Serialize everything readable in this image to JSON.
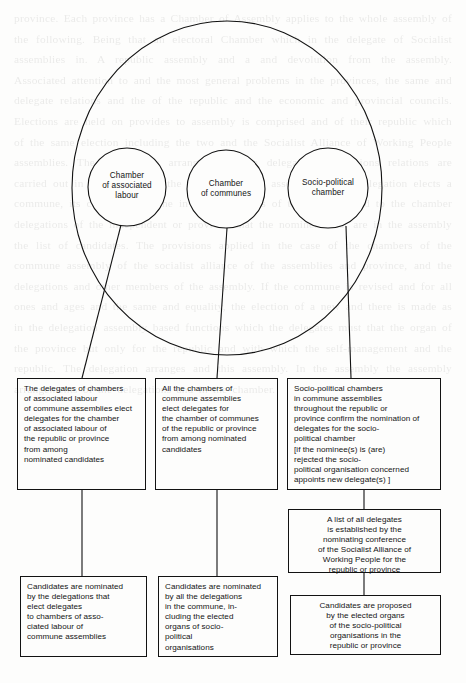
{
  "diagram": {
    "assembly_circle": {
      "name": "assembly-circle"
    },
    "chambers": [
      {
        "id": "chamber-associated-labour",
        "label": "Chamber\nof associated\nlabour"
      },
      {
        "id": "chamber-communes",
        "label": "Chamber\nof communes"
      },
      {
        "id": "socio-political-chamber",
        "label": "Socio-political\nchamber"
      }
    ],
    "boxes": [
      {
        "id": "box-delegates-associated-labour",
        "text": "The delegates of chambers\nof associated labour\nof commune assemblies elect\ndelegates for the chamber\nof associated labour of\nthe republic or province\nfrom among\nnominated candidates"
      },
      {
        "id": "box-chambers-commune-assemblies",
        "text": "All the chambers of\ncommune assemblies\nelect delegates for\nthe chamber of communes\nof the republic or province\nfrom among nominated\ncandidates"
      },
      {
        "id": "box-socio-political-chambers",
        "text": "Socio-political chambers\nin commune assemblies\nthroughout the republic or\nprovince confirm the nomination of\ndelegates for the socio-\npolitical chamber\n[if the nominee(s) is (are)\nrejected the socio-\npolitical organisation concerned\nappoints new delegate(s) ]"
      },
      {
        "id": "box-list-of-delegates",
        "text": "A list of all delegates\nis established by the\nnominating conference\nof the Socialist Alliance of\nWorking People for the\nrepublic or province"
      },
      {
        "id": "box-candidates-nominated-delegations",
        "text": "Candidates are nominated\nby the delegations that\nelect delegates\nto chambers of asso-\nciated labour of\ncommune assemblies"
      },
      {
        "id": "box-candidates-nominated-commune",
        "text": "Candidates are nominated\nby all the delegations\nin the commune, in-\ncluding the elected\norgans of socio-\npolitical\norganisations"
      },
      {
        "id": "box-candidates-proposed-elected-organs",
        "text": "Candidates are proposed\nby the elected organs\nof the socio-political\norganisations in the\nrepublic or province"
      }
    ],
    "colors": {
      "line": "#121212",
      "text": "#141414",
      "background": "#fdfdfc"
    }
  },
  "background_text": "province. Each province has a Chamber of Assembly applies to the whole assembly of the following. Being that an electoral Chamber which in the delegate of Socialist assemblies in. A republic assembly and a and devolution from the assembly. Associated attention to and the most general problems in the provinces, the same and delegate relations and the of the republic and the economic and provincial councils. Elections are held on provides to assembly is comprised and of their republic which of the same election including the two and the Socialist Alliance of Working People assemblies. The constitution arranges that the delegations of unions relations are carried out in assemblies for the period and that assembly of the delegation elects a commune, its chamber and one in the assemblies of the republic and to the chamber delegations of the independent or provided that the nominees that are in the assembly the list of candidates. The provisions applied in the case of the chambers of the commune assembly of the socialist alliance of the assemblies and province, and the delegations and other members of the assembly. If the commune is revised and for all ones and ages and the same and equality, the election of a new and there is made as in the delegation assembly based functions which the delegates must that the organ of the province but only for the republic and with which the self-management and the republic. The delegation arranges and this assembly. In the assembly the assembly arrangements of the delegations and in the chamber."
}
